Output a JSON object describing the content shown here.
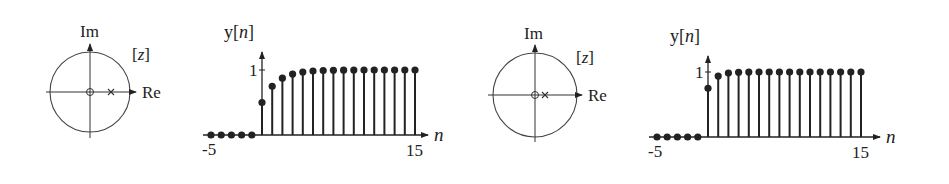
{
  "panels": [
    {
      "pz_plot": {
        "imag_label": "Im",
        "real_label": "Re",
        "plane_label": "[z]",
        "zero": 0,
        "pole": 0.5
      },
      "stem_plot": {
        "ylabel": "y[n]",
        "xlabel": "n",
        "ytick": "1",
        "xtick_left": "-5",
        "xtick_right": "15"
      }
    },
    {
      "pz_plot": {
        "imag_label": "Im",
        "real_label": "Re",
        "plane_label": "[z]",
        "zero": 0,
        "pole": 0.25
      },
      "stem_plot": {
        "ylabel": "y[n]",
        "xlabel": "n",
        "ytick": "1",
        "xtick_left": "-5",
        "xtick_right": "15"
      }
    }
  ],
  "chart_data": [
    {
      "type": "stem",
      "title": "Step response, pole at z = 0.5",
      "xlabel": "n",
      "ylabel": "y[n]",
      "x": [
        -5,
        -4,
        -3,
        -2,
        -1,
        0,
        1,
        2,
        3,
        4,
        5,
        6,
        7,
        8,
        9,
        10,
        11,
        12,
        13,
        14,
        15
      ],
      "values": [
        0,
        0,
        0,
        0,
        0,
        0.5,
        0.75,
        0.875,
        0.938,
        0.969,
        0.984,
        0.992,
        0.996,
        0.998,
        0.999,
        1,
        1,
        1,
        1,
        1,
        1
      ],
      "xlim": [
        -5,
        15
      ],
      "ylim": [
        0,
        1
      ],
      "grid": false
    },
    {
      "type": "stem",
      "title": "Step response, pole at z = 0.25",
      "xlabel": "n",
      "ylabel": "y[n]",
      "x": [
        -5,
        -4,
        -3,
        -2,
        -1,
        0,
        1,
        2,
        3,
        4,
        5,
        6,
        7,
        8,
        9,
        10,
        11,
        12,
        13,
        14,
        15
      ],
      "values": [
        0,
        0,
        0,
        0,
        0,
        0.75,
        0.938,
        0.984,
        0.996,
        0.999,
        1,
        1,
        1,
        1,
        1,
        1,
        1,
        1,
        1,
        1,
        1
      ],
      "xlim": [
        -5,
        15
      ],
      "ylim": [
        0,
        1
      ],
      "grid": false
    }
  ]
}
